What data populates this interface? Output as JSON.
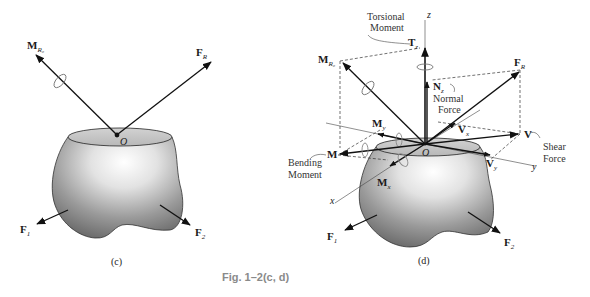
{
  "caption": "Fig. 1–2(c, d)",
  "panel_c": {
    "label": "(c)",
    "origin": "O",
    "vectors": {
      "moment_resultant": {
        "main": "M",
        "sub": "R₀"
      },
      "force_resultant": {
        "main": "F",
        "sub": "R"
      },
      "force_1": {
        "main": "F",
        "sub": "1"
      },
      "force_2": {
        "main": "F",
        "sub": "2"
      }
    }
  },
  "panel_d": {
    "label": "(d)",
    "origin": "O",
    "axes": {
      "x": "x",
      "y": "y",
      "z": "z"
    },
    "annotations": {
      "torsional_moment_1": "Torsional",
      "torsional_moment_2": "Moment",
      "normal_force_1": "Normal",
      "normal_force_2": "Force",
      "shear_force_1": "Shear",
      "shear_force_2": "Force",
      "bending_moment_1": "Bending",
      "bending_moment_2": "Moment"
    },
    "vectors": {
      "torque": {
        "main": "T",
        "sub": "z"
      },
      "moment_resultant": {
        "main": "M",
        "sub": "R₀"
      },
      "force_resultant": {
        "main": "F",
        "sub": "R"
      },
      "normal": {
        "main": "N",
        "sub": "z"
      },
      "shear_x": {
        "main": "V",
        "sub": "x"
      },
      "shear": {
        "main": "V",
        "sub": ""
      },
      "shear_y": {
        "main": "V",
        "sub": "y"
      },
      "moment_y": {
        "main": "M",
        "sub": "y"
      },
      "moment": {
        "main": "M",
        "sub": ""
      },
      "moment_x": {
        "main": "M",
        "sub": "x"
      },
      "force_1": {
        "main": "F",
        "sub": "1"
      },
      "force_2": {
        "main": "F",
        "sub": "2"
      }
    }
  }
}
